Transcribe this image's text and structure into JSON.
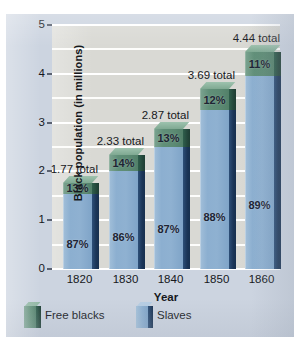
{
  "chart_data": {
    "type": "bar",
    "subtype": "stacked-3d-column",
    "title": "",
    "xlabel": "Year",
    "ylabel": "Black population (in millions)",
    "categories": [
      "1820",
      "1830",
      "1840",
      "1850",
      "1860"
    ],
    "ylim": [
      0,
      5
    ],
    "y_ticks": [
      0,
      1,
      2,
      3,
      4,
      5
    ],
    "y_tick_labels": [
      "0",
      "1",
      "2",
      "3",
      "4",
      "5"
    ],
    "gridlines": {
      "visible": true,
      "interval": 0.5,
      "color": "#ffffff"
    },
    "legend": {
      "position": "below-plot-left",
      "entries": [
        {
          "name": "Free blacks",
          "color": "#5f8f77"
        },
        {
          "name": "Slaves",
          "color": "#8cafd0"
        }
      ]
    },
    "series": [
      {
        "name": "Slaves",
        "color": "#8cafd0",
        "values": [
          1.54,
          2.0,
          2.5,
          3.25,
          3.95
        ]
      },
      {
        "name": "Free blacks",
        "color": "#5f8f77",
        "values": [
          0.23,
          0.33,
          0.37,
          0.44,
          0.49
        ]
      }
    ],
    "totals": [
      1.77,
      2.33,
      2.87,
      3.69,
      4.44
    ],
    "total_labels": [
      "1.77 total",
      "2.33 total",
      "2.87 total",
      "3.69 total",
      "4.44 total"
    ],
    "percent_labels": {
      "free_blacks": [
        "13%",
        "14%",
        "13%",
        "12%",
        "11%"
      ],
      "slaves": [
        "87%",
        "86%",
        "87%",
        "88%",
        "89%"
      ]
    },
    "bars": [
      {
        "year": "1820",
        "total": 1.77,
        "total_label": "1.77 total",
        "free_pct": "13%",
        "slaves_pct": "87%",
        "free_value": 0.23,
        "slaves_value": 1.54
      },
      {
        "year": "1830",
        "total": 2.33,
        "total_label": "2.33 total",
        "free_pct": "14%",
        "slaves_pct": "86%",
        "free_value": 0.33,
        "slaves_value": 2.0
      },
      {
        "year": "1840",
        "total": 2.87,
        "total_label": "2.87 total",
        "free_pct": "13%",
        "slaves_pct": "87%",
        "free_value": 0.37,
        "slaves_value": 2.5
      },
      {
        "year": "1850",
        "total": 3.69,
        "total_label": "3.69 total",
        "free_pct": "12%",
        "slaves_pct": "88%",
        "free_value": 0.44,
        "slaves_value": 3.25
      },
      {
        "year": "1860",
        "total": 4.44,
        "total_label": "4.44 total",
        "free_pct": "11%",
        "slaves_pct": "89%",
        "free_value": 0.49,
        "slaves_value": 3.95
      }
    ],
    "colors": {
      "plot_background": "#d9d9d4",
      "figure_background": "#ccd4e0",
      "slaves_front": "#8cafd0",
      "slaves_side": "#1b3557",
      "free_front": "#5f8f77",
      "free_side": "#23463a",
      "free_top": "#93b9a5",
      "gridline": "#ffffff",
      "text": "#16181c"
    }
  }
}
